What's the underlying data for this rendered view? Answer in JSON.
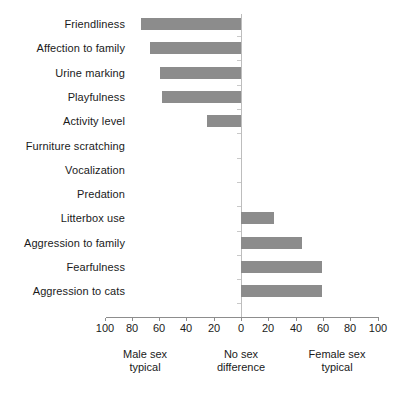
{
  "chart_data": {
    "type": "bar",
    "orientation": "horizontal",
    "title": "",
    "subtitle": "",
    "xlabel": "",
    "ylabel": "",
    "xlim": [
      -100,
      100
    ],
    "grid": false,
    "legend": null,
    "bar_color": "#8c8c8c",
    "axis_color": "#8d8d8d",
    "zero_line_color": "#bdbdbd",
    "tick_labels": [
      "100",
      "80",
      "60",
      "40",
      "20",
      "0",
      "20",
      "40",
      "60",
      "80",
      "100"
    ],
    "tick_values": [
      -100,
      -80,
      -60,
      -40,
      -20,
      0,
      20,
      40,
      60,
      80,
      100
    ],
    "annotations": [
      {
        "name": "male-sex-typical",
        "line1": "Male sex",
        "line2": "typical",
        "at": -70
      },
      {
        "name": "no-sex-difference",
        "line1": "No sex",
        "line2": "difference",
        "at": 0
      },
      {
        "name": "female-sex-typical",
        "line1": "Female sex",
        "line2": "typical",
        "at": 70
      }
    ],
    "categories": [
      "Friendliness",
      "Affection to family",
      "Urine marking",
      "Playfulness",
      "Activity level",
      "Furniture scratching",
      "Vocalization",
      "Predation",
      "Litterbox use",
      "Aggression to family",
      "Fearfulness",
      "Aggression to cats"
    ],
    "values": [
      -73,
      -67,
      -59,
      -58,
      -25,
      0,
      0,
      0,
      24,
      45,
      59,
      59
    ]
  }
}
